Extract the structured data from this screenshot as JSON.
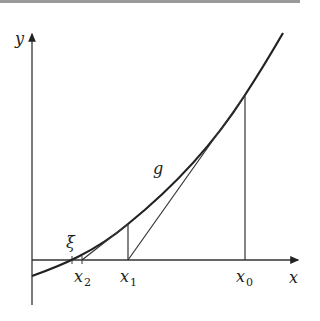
{
  "figure": {
    "axes": {
      "x_label": "x",
      "y_label": "y"
    },
    "curve_label": "g",
    "root_label": "ξ",
    "points": [
      {
        "name": "x",
        "sub": "0"
      },
      {
        "name": "x",
        "sub": "1"
      },
      {
        "name": "x",
        "sub": "2"
      }
    ],
    "colors": {
      "line": "#222222",
      "top_border": "#9a9a9a",
      "background": "#ffffff"
    }
  }
}
